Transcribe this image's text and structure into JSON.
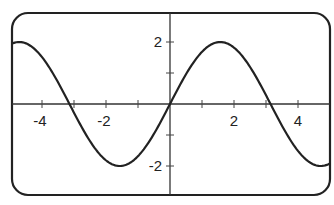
{
  "chart_data": {
    "type": "line",
    "title": "",
    "xlabel": "",
    "ylabel": "",
    "function": "y = 2 sin(x)",
    "xlim": [
      -4.95,
      5.0
    ],
    "ylim": [
      -3.0,
      3.3
    ],
    "grid": false,
    "legend": null,
    "x_ticks": [
      -4,
      -3,
      -2,
      -1,
      1,
      2,
      3,
      4
    ],
    "x_tick_labels": [
      "-4",
      "-2",
      "2",
      "4"
    ],
    "x_tick_label_values": [
      -4,
      -2,
      2,
      4
    ],
    "y_ticks": [
      -2,
      -1,
      1,
      2
    ],
    "y_tick_labels": [
      "2",
      "-2"
    ],
    "y_tick_label_values": [
      2,
      -2
    ],
    "series": [
      {
        "name": "2 sin(x)",
        "color": "#222222",
        "x": [
          -4.95,
          -4.5,
          -4.0,
          -3.5,
          -3.14,
          -3.0,
          -2.5,
          -2.0,
          -1.57,
          -1.0,
          -0.5,
          0.0,
          0.5,
          1.0,
          1.57,
          2.0,
          2.5,
          3.0,
          3.14,
          3.5,
          4.0,
          4.5,
          5.0
        ],
        "y": [
          1.94,
          1.96,
          1.51,
          0.7,
          0.0,
          -0.28,
          -1.2,
          -1.82,
          -2.0,
          -1.68,
          -0.96,
          0.0,
          0.96,
          1.68,
          2.0,
          1.82,
          1.2,
          0.28,
          0.0,
          -0.7,
          -1.51,
          -1.96,
          -1.92
        ]
      }
    ],
    "frame": {
      "style": "rounded-rectangle",
      "color": "#222222"
    }
  }
}
